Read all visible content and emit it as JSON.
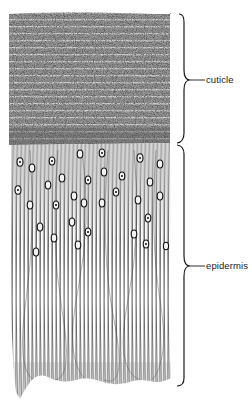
{
  "figure": {
    "type": "histological illustration",
    "layers": [
      {
        "id": "cuticle",
        "label": "cuticle",
        "y_top": 13,
        "y_bottom": 143,
        "texture": "stippled horizontal laminae"
      },
      {
        "id": "epidermis",
        "label": "epidermis",
        "y_top": 143,
        "y_bottom": 385,
        "texture": "vertical elongated cells with oval nuclei in upper half"
      }
    ],
    "colors": {
      "ink": "#1a1a1a",
      "stipple": "#555555",
      "paper": "#ffffff"
    }
  },
  "labels": {
    "cuticle": "cuticle",
    "epidermis": "epidermis"
  }
}
